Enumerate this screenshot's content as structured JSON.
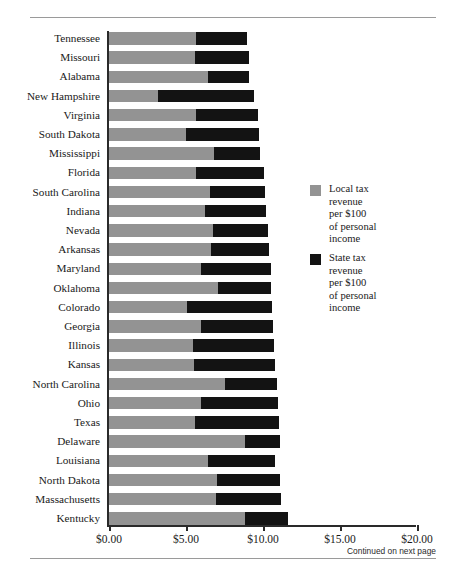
{
  "chart_data": {
    "type": "bar",
    "orientation": "horizontal",
    "stacked": true,
    "title": "",
    "xlabel": "",
    "ylabel": "",
    "xlim": [
      0,
      20
    ],
    "grid": false,
    "legend_position": "right",
    "xticks": [
      0,
      5,
      10,
      15,
      20
    ],
    "xticklabels": [
      "$0.00",
      "$5.00",
      "$10.00",
      "$15.00",
      "$20.00"
    ],
    "categories": [
      "Tennessee",
      "Missouri",
      "Alabama",
      "New Hampshire",
      "Virginia",
      "South Dakota",
      "Mississippi",
      "Florida",
      "South Carolina",
      "Indiana",
      "Nevada",
      "Arkansas",
      "Maryland",
      "Oklahoma",
      "Colorado",
      "Georgia",
      "Illinois",
      "Kansas",
      "North Carolina",
      "Ohio",
      "Texas",
      "Delaware",
      "Louisiana",
      "North Dakota",
      "Massachusetts",
      "Kentucky"
    ],
    "series": [
      {
        "name": "Local tax revenue per $100 of personal income",
        "color": "#939393",
        "values": [
          5.65,
          5.6,
          6.45,
          3.15,
          5.65,
          5.0,
          6.85,
          5.65,
          6.55,
          6.25,
          6.75,
          6.65,
          6.0,
          7.1,
          5.05,
          5.95,
          5.45,
          5.55,
          7.5,
          5.95,
          5.6,
          8.85,
          6.4,
          7.0,
          6.95,
          8.85
        ]
      },
      {
        "name": "State tax revenue per $100 of personal income",
        "color": "#131313",
        "values": [
          3.3,
          3.5,
          2.65,
          6.25,
          4.05,
          4.75,
          2.95,
          4.4,
          3.55,
          3.95,
          3.55,
          3.75,
          4.5,
          3.45,
          5.55,
          4.7,
          5.25,
          5.2,
          3.4,
          5.05,
          5.45,
          2.25,
          4.4,
          4.1,
          4.25,
          2.75
        ]
      }
    ],
    "totals": [
      8.95,
      9.1,
      9.1,
      9.4,
      9.7,
      9.75,
      9.8,
      10.05,
      10.1,
      10.2,
      10.3,
      10.4,
      10.5,
      10.55,
      10.6,
      10.65,
      10.7,
      10.75,
      10.9,
      11.0,
      11.05,
      11.1,
      10.8,
      11.1,
      11.2,
      11.6
    ]
  },
  "legend": {
    "entries": [
      {
        "swatch": "local",
        "lines": [
          "Local tax",
          "revenue",
          "per $100",
          "of personal",
          "income"
        ]
      },
      {
        "swatch": "state",
        "lines": [
          "State tax",
          "revenue",
          "per $100",
          "of personal",
          "income"
        ]
      }
    ]
  },
  "footnote": "Continued on next page"
}
